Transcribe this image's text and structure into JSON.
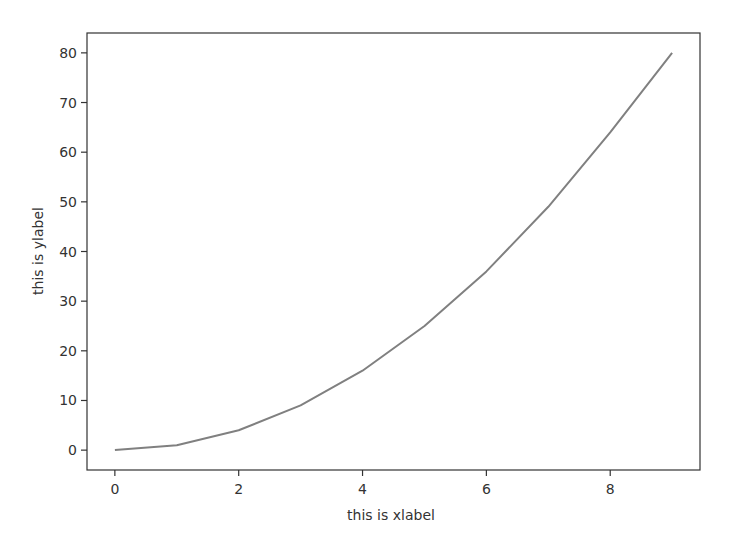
{
  "chart_data": {
    "type": "line",
    "title": "",
    "xlabel": "this is xlabel",
    "ylabel": "this is ylabel",
    "x": [
      0,
      1,
      2,
      3,
      4,
      5,
      6,
      7,
      8,
      9
    ],
    "series": [
      {
        "name": "",
        "values": [
          0,
          1,
          4,
          9,
          16,
          25,
          36,
          49,
          64,
          80
        ],
        "color": "#808080"
      }
    ],
    "xticks": [
      0,
      2,
      4,
      6,
      8
    ],
    "yticks": [
      0,
      10,
      20,
      30,
      40,
      50,
      60,
      70,
      80
    ],
    "xlim": [
      -0.45,
      9.45
    ],
    "ylim": [
      -4,
      84
    ],
    "grid": false,
    "legend": null
  },
  "colors": {
    "line": "#808080",
    "axes": "#333333",
    "background": "#ffffff"
  }
}
